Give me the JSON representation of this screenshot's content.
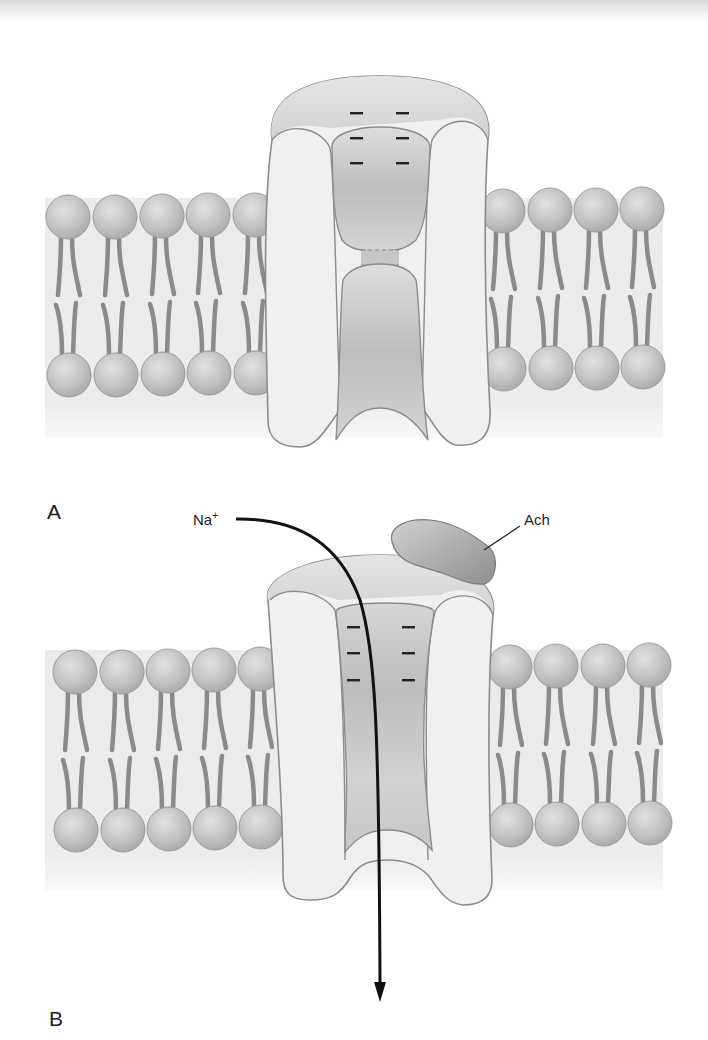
{
  "figure": {
    "panels": [
      {
        "id": "A",
        "label": "A",
        "state": "closed",
        "charges_per_side": 3,
        "charge_symbol": "–"
      },
      {
        "id": "B",
        "label": "B",
        "state": "open",
        "charges_per_side": 3,
        "charge_symbol": "–",
        "ion_label": "Na",
        "ion_charge": "+",
        "ligand_label": "Ach"
      }
    ],
    "membrane": {
      "left_phospholipids": 5,
      "right_phospholipids": 4
    },
    "colors": {
      "membrane_band": "#ececec",
      "lipid_head": "#bdbdbd",
      "lipid_tail": "#8a8a8a",
      "channel_body": "#f0f0f0",
      "channel_outline": "#8c8c8c",
      "pore": "#c4c4c4",
      "ligand": "#a9a9a9",
      "arrow": "#111111"
    }
  }
}
